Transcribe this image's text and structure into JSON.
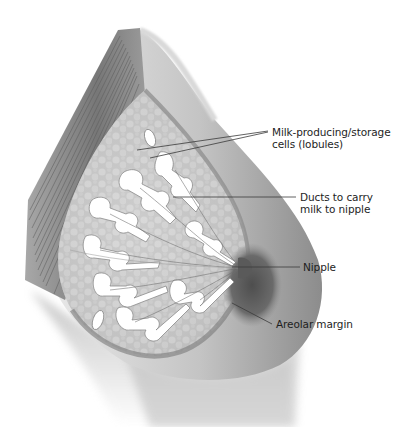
{
  "diagram": {
    "style": "grayscale medical illustration",
    "colors": {
      "background": "#ffffff",
      "text": "#1e1e1e",
      "leader_line": "#3a3a3a",
      "skin_mid": "#b5b5b5",
      "skin_dark": "#6f6f6f",
      "tissue_light": "#d8d8d8",
      "duct_fill": "#ffffff",
      "muscle": "#8a8a8a"
    },
    "labels": [
      {
        "id": "lobules",
        "line1": "Milk-producing/storage",
        "line2": "cells (lobules)"
      },
      {
        "id": "ducts",
        "line1": "Ducts to carry",
        "line2": "milk to nipple"
      },
      {
        "id": "nipple",
        "line1": "Nipple"
      },
      {
        "id": "areolar",
        "line1": "Areolar margin"
      }
    ]
  }
}
